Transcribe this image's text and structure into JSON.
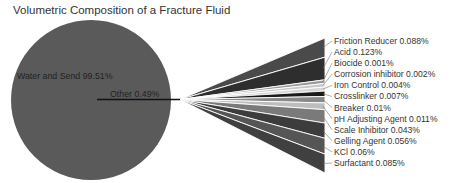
{
  "chart_data": {
    "type": "pie",
    "subtype": "pie-of-pie (bar fan breakout)",
    "title": "Volumetric Composition of a Fracture Fluid",
    "main_slices": [
      {
        "label": "Water and Sand",
        "value": 99.51,
        "text": "Water and Send 99.51%",
        "color": "#5a5a5a"
      },
      {
        "label": "Other",
        "value": 0.49,
        "text": "Other 0.49%",
        "color": "#111111"
      }
    ],
    "breakout": [
      {
        "label": "Friction Reducer",
        "value": 0.088,
        "text": "Friction Reducer 0.088%",
        "color": "#4a4a4a"
      },
      {
        "label": "Acid",
        "value": 0.123,
        "text": "Acid 0.123%",
        "color": "#2e2e2e"
      },
      {
        "label": "Biocide",
        "value": 0.001,
        "text": "Biocide 0.001%",
        "color": "#9a9a9a"
      },
      {
        "label": "Corrosion inhibitor",
        "value": 0.002,
        "text": "Corrosion  inhibitor 0.002%",
        "color": "#c8c8c8"
      },
      {
        "label": "Iron Control",
        "value": 0.004,
        "text": "Iron Control 0.004%",
        "color": "#d6d6d6"
      },
      {
        "label": "Crosslinker",
        "value": 0.007,
        "text": "Crosslinker 0.007%",
        "color": "#1a1a1a"
      },
      {
        "label": "Breaker",
        "value": 0.01,
        "text": "Breaker 0.01%",
        "color": "#8a8a8a"
      },
      {
        "label": "pH Adjusting Agent",
        "value": 0.011,
        "text": "pH Adjusting Agent 0.011%",
        "color": "#bdbdbd"
      },
      {
        "label": "Scale Inhibitor",
        "value": 0.043,
        "text": "Scale Inhibitor 0.043%",
        "color": "#7a7a7a"
      },
      {
        "label": "Gelling Agent",
        "value": 0.056,
        "text": "Gelling Agent 0.056%",
        "color": "#3c3c3c"
      },
      {
        "label": "KCl",
        "value": 0.06,
        "text": "KCl 0.06%",
        "color": "#555555"
      },
      {
        "label": "Surfactant",
        "value": 0.085,
        "text": "Surfactant 0.085%",
        "color": "#404040"
      }
    ],
    "legend": "none (data labels with leader lines)",
    "units": "%"
  }
}
